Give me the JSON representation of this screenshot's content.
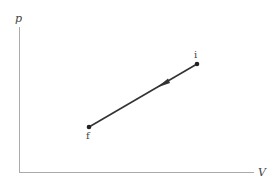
{
  "diagram": {
    "type": "pV process diagram",
    "axes": {
      "y_label": "p",
      "x_label": "V",
      "color": "#aaaaaa"
    },
    "process": {
      "direction": "from i to f",
      "line_color": "#333333",
      "points": [
        {
          "label": "i",
          "x": 197,
          "y": 64
        },
        {
          "label": "f",
          "x": 89,
          "y": 127
        }
      ]
    }
  }
}
